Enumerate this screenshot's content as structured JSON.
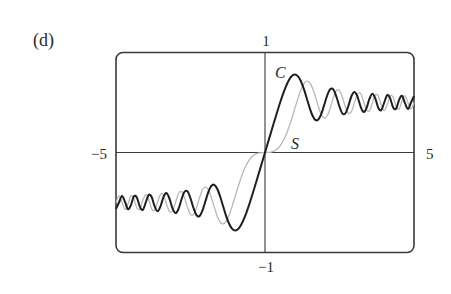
{
  "panel_label": "(d)",
  "colors": {
    "frame": "#3a3a3a",
    "axes": "#3a3a3a",
    "series_C": "#1e1e1e",
    "series_S": "#b8b8b8",
    "text": "#2a2a2a"
  },
  "chart_data": {
    "type": "line",
    "title": "",
    "xlabel": "",
    "ylabel": "",
    "xlim": [
      -5,
      5
    ],
    "ylim": [
      -1,
      1
    ],
    "grid": false,
    "legend": "inline labels",
    "axis_labels": {
      "x_min": "−5",
      "x_max": "5",
      "y_max": "1",
      "y_min": "−1"
    },
    "annotations": [
      {
        "text": "C",
        "x": 0.35,
        "y": 0.78,
        "series": "C"
      },
      {
        "text": "S",
        "x": 1.0,
        "y": 0.06,
        "series": "S"
      }
    ],
    "x": [
      0.0,
      0.1,
      0.2,
      0.3,
      0.4,
      0.5,
      0.6,
      0.7,
      0.8,
      0.9,
      1.0,
      1.1,
      1.2,
      1.3,
      1.4,
      1.5,
      1.6,
      1.7,
      1.8,
      1.9,
      2.0,
      2.1,
      2.2,
      2.3,
      2.4,
      2.5,
      2.6,
      2.7,
      2.8,
      2.9,
      3.0,
      3.1,
      3.2,
      3.3,
      3.4,
      3.5,
      3.6,
      3.7,
      3.8,
      3.9,
      4.0,
      4.1,
      4.2,
      4.3,
      4.4,
      4.5,
      4.6,
      4.7,
      4.8,
      4.9,
      5.0
    ],
    "symmetry": "odd (values for negative x are negatives of positive-x values)",
    "series": [
      {
        "name": "C",
        "values": [
          0.0,
          0.0999,
          0.1999,
          0.2994,
          0.3975,
          0.4923,
          0.5811,
          0.6597,
          0.7228,
          0.7648,
          0.7799,
          0.7638,
          0.7154,
          0.6386,
          0.5431,
          0.4453,
          0.3655,
          0.3238,
          0.3336,
          0.3944,
          0.4882,
          0.5816,
          0.6363,
          0.6266,
          0.555,
          0.4574,
          0.389,
          0.3925,
          0.4675,
          0.5624,
          0.6058,
          0.5616,
          0.4664,
          0.4058,
          0.4385,
          0.5326,
          0.588,
          0.542,
          0.4481,
          0.4223,
          0.4984,
          0.5738,
          0.5418,
          0.4494,
          0.4383,
          0.5261,
          0.5673,
          0.4914,
          0.4338,
          0.5002,
          0.5637
        ]
      },
      {
        "name": "S",
        "values": [
          0.0,
          0.0005,
          0.0042,
          0.0141,
          0.0334,
          0.0647,
          0.1105,
          0.1721,
          0.2493,
          0.3398,
          0.4383,
          0.5365,
          0.6234,
          0.6863,
          0.7135,
          0.6975,
          0.6389,
          0.5492,
          0.4509,
          0.3733,
          0.3434,
          0.3743,
          0.4557,
          0.5532,
          0.6197,
          0.6192,
          0.55,
          0.4529,
          0.3915,
          0.4101,
          0.4963,
          0.5818,
          0.5933,
          0.5192,
          0.4296,
          0.4152,
          0.4923,
          0.575,
          0.5656,
          0.4752,
          0.4205,
          0.4758,
          0.5633,
          0.554,
          0.4622,
          0.4342,
          0.5162,
          0.5672,
          0.4968,
          0.435,
          0.4992
        ]
      }
    ]
  }
}
